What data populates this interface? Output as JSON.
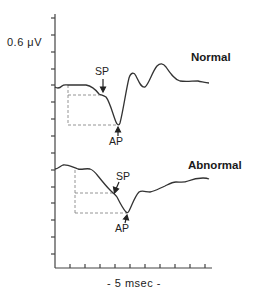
{
  "figure": {
    "scale_bar_label": "0.6 μV",
    "time_label": "- 5 msec -",
    "traces": [
      {
        "id": "normal",
        "title": "Normal",
        "markers": [
          "SP",
          "AP"
        ]
      },
      {
        "id": "abnormal",
        "title": "Abnormal",
        "markers": [
          "SP",
          "AP"
        ]
      }
    ],
    "colors": {
      "trace": "#333333",
      "axis": "#444444",
      "dashed": "#888888",
      "text": "#222222"
    }
  }
}
